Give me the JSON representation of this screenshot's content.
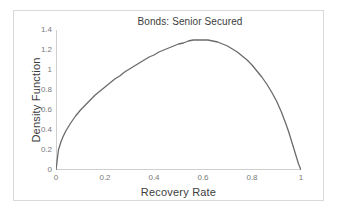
{
  "chart_data": {
    "type": "line",
    "title": "Bonds: Senior Secured",
    "xlabel": "Recovery Rate",
    "ylabel": "Density Function",
    "xlim": [
      0,
      1
    ],
    "ylim": [
      0,
      1.4
    ],
    "grid": false,
    "legend": null,
    "xticks": [
      "0",
      "0.2",
      "0.4",
      "0.6",
      "0.8",
      "1"
    ],
    "xtick_values": [
      0,
      0.2,
      0.4,
      0.6,
      0.8,
      1
    ],
    "yticks": [
      "0",
      "0.2",
      "0.4",
      "0.6",
      "0.8",
      "1",
      "1.2",
      "1.4"
    ],
    "ytick_values": [
      0,
      0.2,
      0.4,
      0.6,
      0.8,
      1,
      1.2,
      1.4
    ],
    "series": [
      {
        "name": "Density Function",
        "color": "#6b6b6b",
        "x": [
          0.0,
          0.01,
          0.02,
          0.03,
          0.04,
          0.05,
          0.06,
          0.08,
          0.1,
          0.12,
          0.14,
          0.16,
          0.18,
          0.2,
          0.22,
          0.24,
          0.26,
          0.28,
          0.3,
          0.32,
          0.34,
          0.36,
          0.38,
          0.4,
          0.42,
          0.44,
          0.46,
          0.48,
          0.5,
          0.52,
          0.54,
          0.56,
          0.58,
          0.6,
          0.62,
          0.64,
          0.66,
          0.68,
          0.7,
          0.72,
          0.74,
          0.76,
          0.78,
          0.8,
          0.82,
          0.84,
          0.86,
          0.88,
          0.9,
          0.92,
          0.94,
          0.95,
          0.96,
          0.97,
          0.98,
          0.99,
          1.0
        ],
        "y": [
          0.0,
          0.2,
          0.28,
          0.34,
          0.39,
          0.43,
          0.47,
          0.54,
          0.6,
          0.65,
          0.7,
          0.75,
          0.79,
          0.83,
          0.87,
          0.91,
          0.94,
          0.98,
          1.01,
          1.04,
          1.07,
          1.1,
          1.13,
          1.15,
          1.18,
          1.2,
          1.22,
          1.24,
          1.26,
          1.27,
          1.29,
          1.3,
          1.3,
          1.3,
          1.3,
          1.29,
          1.28,
          1.26,
          1.24,
          1.21,
          1.18,
          1.14,
          1.1,
          1.05,
          0.99,
          0.93,
          0.86,
          0.78,
          0.69,
          0.58,
          0.45,
          0.38,
          0.3,
          0.22,
          0.14,
          0.06,
          0.0
        ]
      }
    ]
  },
  "figure": {
    "title": "Bonds: Senior Secured",
    "xlabel": "Recovery Rate",
    "ylabel": "Density Function"
  }
}
